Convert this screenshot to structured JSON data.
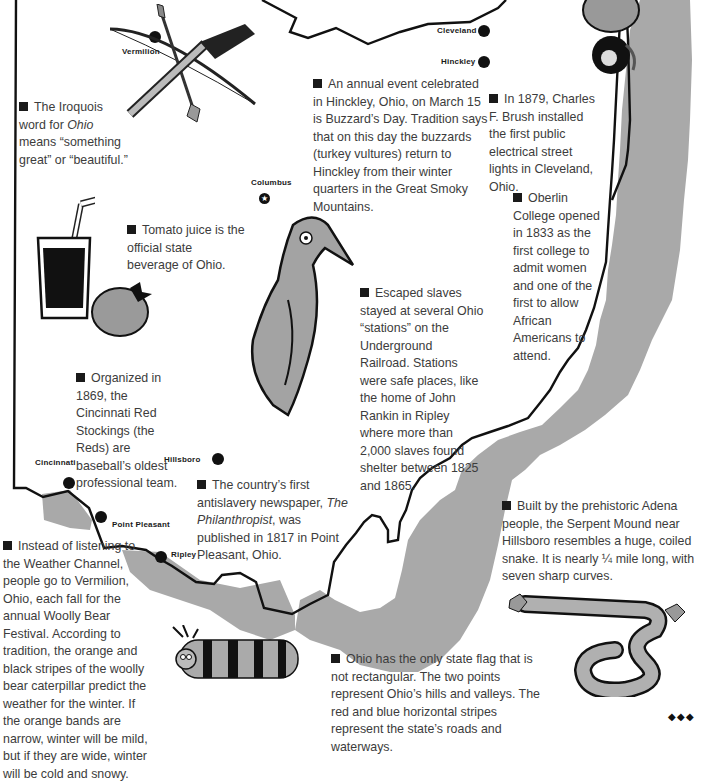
{
  "map": {
    "title": "Ohio facts map",
    "colors": {
      "outline": "#111111",
      "shade": "#a8a8a8",
      "background": "#ffffff",
      "text": "#3c3c3c"
    },
    "cities": [
      {
        "name": "Vermilion",
        "x": 155,
        "y": 37,
        "label_x": 122,
        "label_y": 50
      },
      {
        "name": "Cleveland",
        "x": 484,
        "y": 30,
        "label_x": 437,
        "label_y": 27
      },
      {
        "name": "Hinckley",
        "x": 484,
        "y": 61,
        "label_x": 441,
        "label_y": 58
      },
      {
        "name": "Columbus",
        "x": 265,
        "y": 196,
        "label_x": 252,
        "label_y": 180,
        "capital": true
      },
      {
        "name": "Hillsboro",
        "x": 218,
        "y": 459,
        "label_x": 164,
        "label_y": 456
      },
      {
        "name": "Cincinnati",
        "x": 69,
        "y": 483,
        "label_x": 35,
        "label_y": 460
      },
      {
        "name": "Point Pleasant",
        "x": 101,
        "y": 517,
        "label_x": 112,
        "label_y": 521
      },
      {
        "name": "Ripley",
        "x": 161,
        "y": 557,
        "label_x": 171,
        "label_y": 551
      }
    ],
    "capital_icon": "star-icon"
  },
  "facts": [
    {
      "id": "iroquois",
      "parts": [
        "The Iroquois word for ",
        "Ohio",
        " means “something great” or “beautiful.”"
      ]
    },
    {
      "id": "buzzard",
      "text": "An annual event celebrated in Hinckley, Ohio, on March 15 is Buzzard’s Day.  Tradition says that on this day the buzzards (turkey vultures) return to Hinckley from their winter quarters in the Great Smoky Mountains."
    },
    {
      "id": "brush",
      "text": "In 1879, Charles F. Brush installed the first public electrical street lights in Cleveland, Ohio."
    },
    {
      "id": "oberlin",
      "text": "Oberlin College opened in 1833 as the first college to admit women and one of the first to allow African Americans to attend."
    },
    {
      "id": "tomato",
      "text": "Tomato juice is the official state beverage of Ohio."
    },
    {
      "id": "railroad",
      "text": "Escaped slaves stayed at several Ohio “stations” on the Underground Railroad. Stations were safe places, like the home of John Rankin in Ripley where more than 2,000 slaves found shelter between 1825 and 1865."
    },
    {
      "id": "reds",
      "text": "Organized in 1869, the Cincinnati Red Stockings (the Reds) are baseball’s oldest professional team."
    },
    {
      "id": "newspaper",
      "parts": [
        "The country’s first antislavery newspaper, ",
        "The Philanthropist",
        ", was published in 1817 in Point Pleasant, Ohio."
      ]
    },
    {
      "id": "woolly",
      "text": "Instead of listening to the Weather Channel, people go to Vermilion, Ohio, each fall for the annual Woolly Bear Festival. According to tradition, the orange and black stripes of the woolly bear caterpillar predict the weather for the winter.  If the orange bands are narrow, winter will be mild, but if they are wide, winter will be cold and snowy."
    },
    {
      "id": "serpent",
      "text": "Built by the prehistoric Adena people, the Serpent Mound near Hillsboro resembles a huge, coiled snake.  It is nearly ¼ mile long, with seven sharp curves."
    },
    {
      "id": "flag",
      "text": "Ohio has the only state flag that is not rectangular.  The two points represent Ohio’s hills and valleys.  The red and blue horizontal stripes represent the state’s roads and waterways."
    }
  ],
  "illustrations": [
    {
      "name": "rifle-and-bow-icon"
    },
    {
      "name": "street-light-bell-icon"
    },
    {
      "name": "tomato-juice-glass-icon"
    },
    {
      "name": "tomato-icon"
    },
    {
      "name": "buzzard-icon"
    },
    {
      "name": "woolly-bear-caterpillar-icon"
    },
    {
      "name": "serpent-mound-icon"
    }
  ],
  "page_mark": "◆◆◆"
}
